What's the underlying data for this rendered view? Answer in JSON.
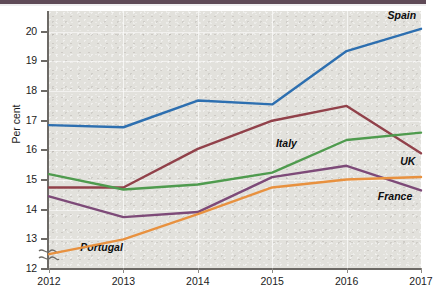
{
  "chart_data": {
    "type": "line",
    "title": "",
    "subtitle": "",
    "xlabel": "",
    "ylabel": "Per cent",
    "categories": [
      "2012",
      "2013",
      "2014",
      "2015",
      "2016",
      "2017"
    ],
    "x": [
      2012,
      2013,
      2014,
      2015,
      2016,
      2017
    ],
    "xlim": [
      2012,
      2017
    ],
    "ylim": [
      12,
      20.7
    ],
    "yticks": [
      12,
      13,
      14,
      15,
      16,
      17,
      18,
      19,
      20
    ],
    "ytick_labels": [
      "12",
      "13",
      "14",
      "15",
      "16",
      "17",
      "18",
      "19",
      "20"
    ],
    "y_axis_break": true,
    "y_axis_break_note": "axis break squiggle below 12",
    "grid": "both-faint",
    "legend_position": "inline-right-end-labels",
    "series": [
      {
        "name": "Spain",
        "color": "#2d6fb0",
        "values": [
          16.85,
          16.78,
          17.68,
          17.55,
          19.35,
          20.1
        ],
        "label_x": 2016.55,
        "label_y": 20.52
      },
      {
        "name": "Italy",
        "color": "#91414a",
        "values": [
          14.75,
          14.75,
          16.05,
          17.0,
          17.5,
          15.9
        ],
        "label_x": 2015.05,
        "label_y": 16.22
      },
      {
        "name": "UK",
        "color": "#4f9b4e",
        "values": [
          15.2,
          14.68,
          14.85,
          15.25,
          16.35,
          16.6
        ],
        "label_x": 2016.72,
        "label_y": 15.62
      },
      {
        "name": "France",
        "color": "#7d4a78",
        "values": [
          14.45,
          13.75,
          13.92,
          15.1,
          15.48,
          14.65
        ],
        "label_x": 2016.42,
        "label_y": 14.42
      },
      {
        "name": "Portugal",
        "color": "#e8913f",
        "values": [
          12.5,
          13.0,
          13.85,
          14.75,
          15.02,
          15.1
        ],
        "label_x": 2012.42,
        "label_y": 12.72
      }
    ]
  },
  "colors": {
    "plot_background": "#e2e1dc",
    "page_background": "#ffffff",
    "axis": "#6d6a66",
    "top_band": "#5f4a57"
  }
}
